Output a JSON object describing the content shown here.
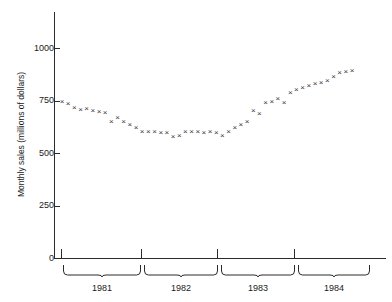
{
  "chart_data": {
    "type": "scatter",
    "title": "",
    "subtitle": "",
    "xlabel": "",
    "ylabel": "Monthly sales (millions of dollars)",
    "ylim": [
      0,
      1060
    ],
    "yticks": [
      0,
      250,
      500,
      750,
      1000
    ],
    "ytick_labels": [
      "0",
      "250",
      "500",
      "750",
      "1000"
    ],
    "grid": false,
    "legend": null,
    "marker": "x",
    "marker_color": "#3a3a3a",
    "x_group_labels": [
      "1981",
      "1982",
      "1983",
      "1984"
    ],
    "x_group_ticks": [
      61,
      141,
      217,
      294
    ],
    "categories": [
      "1981-01",
      "1981-02",
      "1981-03",
      "1981-04",
      "1981-05",
      "1981-06",
      "1981-07",
      "1981-08",
      "1981-09",
      "1981-10",
      "1981-11",
      "1981-12",
      "1982-01",
      "1982-02",
      "1982-03",
      "1982-04",
      "1982-05",
      "1982-06",
      "1982-07",
      "1982-08",
      "1982-09",
      "1982-10",
      "1982-11",
      "1982-12",
      "1983-01",
      "1983-02",
      "1983-03",
      "1983-04",
      "1983-05",
      "1983-06",
      "1983-07",
      "1983-08",
      "1983-09",
      "1983-10",
      "1983-11",
      "1983-12",
      "1984-01",
      "1984-02",
      "1984-03",
      "1984-04",
      "1984-05",
      "1984-06",
      "1984-07",
      "1984-08",
      "1984-09",
      "1984-10",
      "1984-11",
      "1984-12"
    ],
    "values": [
      745,
      735,
      712,
      705,
      710,
      700,
      695,
      690,
      648,
      665,
      650,
      635,
      620,
      600,
      598,
      600,
      595,
      595,
      575,
      580,
      598,
      600,
      600,
      595,
      600,
      595,
      580,
      600,
      618,
      635,
      648,
      700,
      685,
      740,
      745,
      755,
      740,
      785,
      800,
      810,
      820,
      830,
      835,
      845,
      860,
      880,
      888,
      890
    ]
  },
  "axis": {
    "y_title": "Monthly sales (millions of dollars)",
    "y_labels": [
      "1000",
      "750",
      "500",
      "250",
      "0"
    ],
    "x_groups": [
      {
        "label": "1981",
        "left": 63,
        "width": 78
      },
      {
        "label": "1982",
        "left": 144,
        "width": 74
      },
      {
        "label": "1983",
        "left": 221,
        "width": 74
      },
      {
        "label": "1984",
        "left": 298,
        "width": 72
      }
    ]
  },
  "colors": {
    "axis": "#2b2b2b",
    "marker": "#3a3a3a",
    "text": "#1a1a1a",
    "background": "#ffffff"
  }
}
